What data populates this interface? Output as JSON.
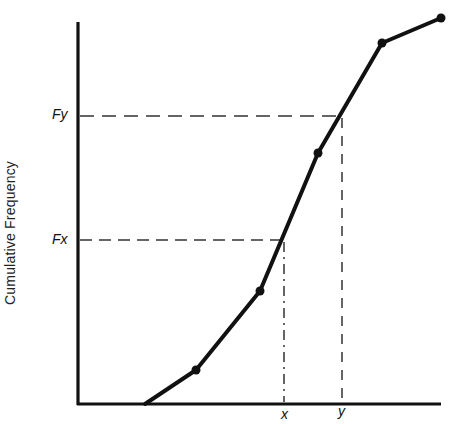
{
  "chart_data": {
    "type": "line",
    "title": "",
    "xlabel": "",
    "ylabel": "Cumulative Frequency",
    "x_tick_labels": [
      "x",
      "y"
    ],
    "y_tick_labels": [
      "Fx",
      "Fy"
    ],
    "grid": false,
    "legend": null,
    "pixel_points": [
      [
        145,
        404
      ],
      [
        196,
        370
      ],
      [
        260,
        291
      ],
      [
        318,
        153
      ],
      [
        382,
        43
      ],
      [
        441,
        18
      ]
    ],
    "markers": [
      [
        196,
        370
      ],
      [
        260,
        291
      ],
      [
        318,
        153
      ],
      [
        382,
        43
      ],
      [
        441,
        18
      ]
    ],
    "annotations": [
      {
        "label": "Fx",
        "type": "dashed-guide",
        "axis_y": 240,
        "curve_x": 284,
        "x_label": "x"
      },
      {
        "label": "Fy",
        "type": "dashed-guide",
        "axis_y": 116,
        "curve_x": 342,
        "x_label": "y"
      }
    ],
    "axes": {
      "origin": [
        78,
        404
      ],
      "x_end": 440,
      "y_top": 22
    },
    "colors": {
      "line": "#111111",
      "axis": "#111111",
      "guide": "#333333"
    }
  },
  "labels": {
    "ylabel": "Cumulative Frequency",
    "fx": "Fx",
    "fy": "Fy",
    "x": "x",
    "y": "y"
  }
}
